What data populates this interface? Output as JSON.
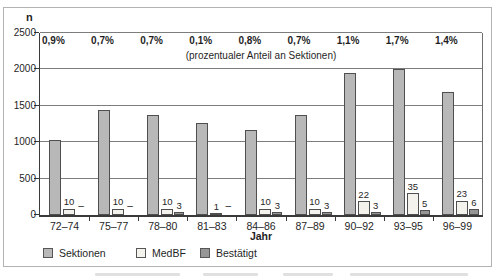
{
  "chart_data": {
    "type": "bar",
    "title": "",
    "subtitle": "(prozentualer Anteil an Sektionen)",
    "ylabel": "n",
    "xlabel": "Jahr",
    "ylim": [
      0,
      2500
    ],
    "grid": true,
    "y_ticks": [
      "2500",
      "2000",
      "1500",
      "1000",
      "500",
      "0"
    ],
    "y_tick_values": [
      2500,
      2000,
      1500,
      1000,
      500,
      0
    ],
    "categories": [
      "72–74",
      "75–77",
      "78–80",
      "81–83",
      "84–86",
      "87–89",
      "90–92",
      "93–95",
      "96–99"
    ],
    "percent_labels": [
      "0,9%",
      "0,7%",
      "0,7%",
      "0,1%",
      "0,8%",
      "0,7%",
      "1,1%",
      "1,7%",
      "1,4%"
    ],
    "series": [
      {
        "name": "Sektionen",
        "values": [
          1030,
          1440,
          1380,
          1270,
          1170,
          1380,
          1950,
          2000,
          1690
        ],
        "value_labels_shown": false
      },
      {
        "name": "MedBF",
        "values": [
          10,
          10,
          10,
          1,
          10,
          10,
          22,
          35,
          23
        ],
        "value_labels_shown": true
      },
      {
        "name": "Bestätigt",
        "values": [
          null,
          null,
          3,
          null,
          3,
          3,
          3,
          5,
          6
        ],
        "value_labels_shown": true
      }
    ],
    "null_marker": "–",
    "legend_position": "bottom",
    "legend": [
      {
        "label": "Sektionen",
        "color": "#b8b8b8"
      },
      {
        "label": "MedBF",
        "color": "#f3f2ec"
      },
      {
        "label": "Bestätigt",
        "color": "#969696"
      }
    ],
    "colors": {
      "bar_border": "#4f4f4f",
      "axis": "#3a3a3a",
      "gridline": "#7d7d7d",
      "frame_border": "#b3b3b3"
    }
  }
}
